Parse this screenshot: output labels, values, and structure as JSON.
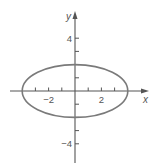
{
  "chart_data": {
    "type": "line",
    "title": "",
    "xlabel": "x",
    "ylabel": "y",
    "xlim": [
      -5,
      5.5
    ],
    "ylim": [
      -5.5,
      6
    ],
    "grid": false,
    "legend": null,
    "x_tick_labels": [
      {
        "value": -2,
        "label": "−2"
      },
      {
        "value": 2,
        "label": "2"
      }
    ],
    "y_tick_labels": [
      {
        "value": 4,
        "label": "4"
      },
      {
        "value": -4,
        "label": "−4"
      }
    ],
    "x_ticks": [
      -3,
      -2,
      -1,
      1,
      2,
      3
    ],
    "y_ticks": [
      -4,
      -3,
      -2,
      -1,
      1,
      2,
      3,
      4
    ],
    "series": [
      {
        "name": "ellipse",
        "equation": "x^2/16 + y^2/4 = 1",
        "shape": "ellipse",
        "center": [
          0,
          0
        ],
        "semi_major_x": 4,
        "semi_minor_y": 2,
        "vertices": [
          [
            -4,
            0
          ],
          [
            4,
            0
          ]
        ],
        "covertices": [
          [
            0,
            2
          ],
          [
            0,
            -2
          ]
        ]
      }
    ]
  },
  "colors": {
    "axis": "#555555",
    "curve": "#7a7a7a"
  }
}
